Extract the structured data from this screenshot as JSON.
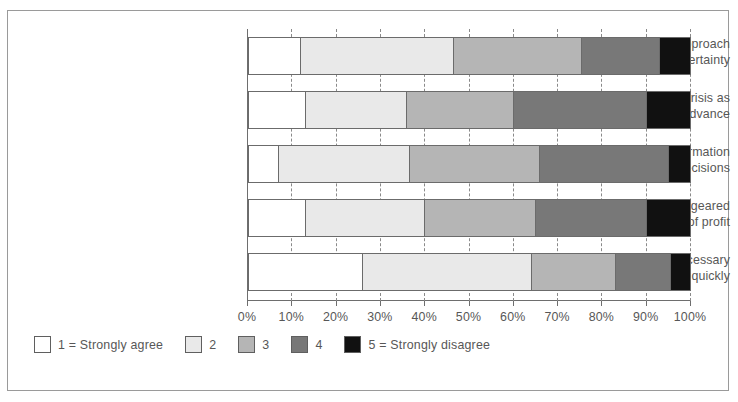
{
  "chart_data": {
    "type": "bar",
    "orientation": "horizontal",
    "stacked": true,
    "normalized_percent": true,
    "title": "",
    "subtitle": "",
    "xlabel": "",
    "ylabel": "",
    "xlim": [
      0,
      100
    ],
    "grid": true,
    "grid_style": "dashed vertical",
    "legend_position": "bottom-left",
    "tick_labels": [
      "0%",
      "10%",
      "20%",
      "30%",
      "40%",
      "50%",
      "60%",
      "70%",
      "80%",
      "90%",
      "100%"
    ],
    "tick_values": [
      0,
      10,
      20,
      30,
      40,
      50,
      60,
      70,
      80,
      90,
      100
    ],
    "categories": [
      "Had a well-developed approach\nto managing uncertainty",
      "Viewed the crisis as\nopportunity to advance",
      "Easy to find information\nneeded to make decisions",
      "Dominant response geared\ntowards preservation of profit",
      "Made necessary\ndecisions quickly"
    ],
    "series": [
      {
        "name": "1 = Strongly agree",
        "color": "#ffffff",
        "values": [
          12,
          13,
          7,
          13,
          26
        ]
      },
      {
        "name": "2",
        "color": "#e9e9e9",
        "values": [
          34.5,
          23,
          29.5,
          27,
          38
        ]
      },
      {
        "name": "3",
        "color": "#b5b5b5",
        "values": [
          29,
          24,
          29.5,
          25,
          19
        ]
      },
      {
        "name": "4",
        "color": "#787878",
        "values": [
          17.5,
          30,
          29,
          25,
          12.5
        ]
      },
      {
        "name": "5 = Strongly disagree",
        "color": "#111111",
        "values": [
          7,
          10,
          5,
          10,
          4.5
        ]
      }
    ]
  },
  "legend": {
    "items": [
      {
        "label": "1 = Strongly agree",
        "color": "#ffffff"
      },
      {
        "label": "2",
        "color": "#e9e9e9"
      },
      {
        "label": "3",
        "color": "#b5b5b5"
      },
      {
        "label": "4",
        "color": "#787878"
      },
      {
        "label": "5 = Strongly disagree",
        "color": "#111111"
      }
    ]
  },
  "colors": {
    "frame_border": "#9a9a9a",
    "axis": "#6e6e6e",
    "text": "#575757",
    "bar_outline": "#6b6b6b"
  }
}
